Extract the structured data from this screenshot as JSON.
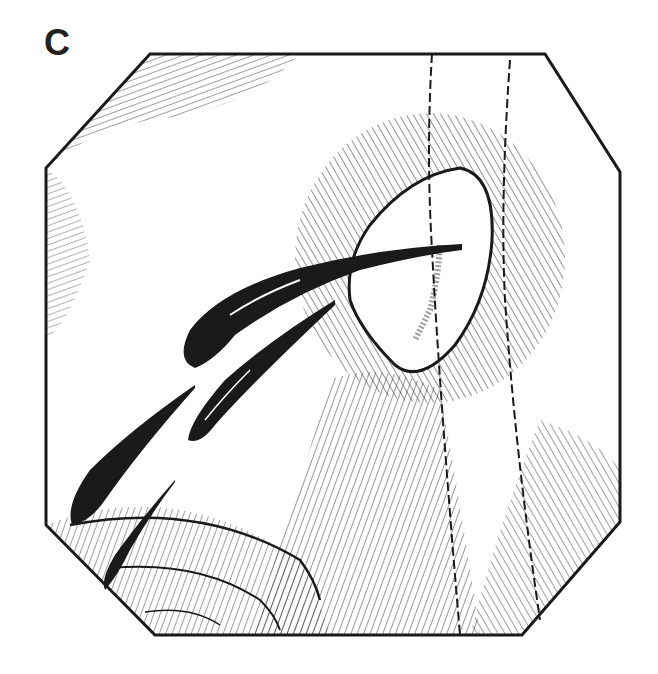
{
  "figure": {
    "panel_label": "C",
    "colors": {
      "ink": "#1a1a1a",
      "background": "#ffffff"
    }
  }
}
